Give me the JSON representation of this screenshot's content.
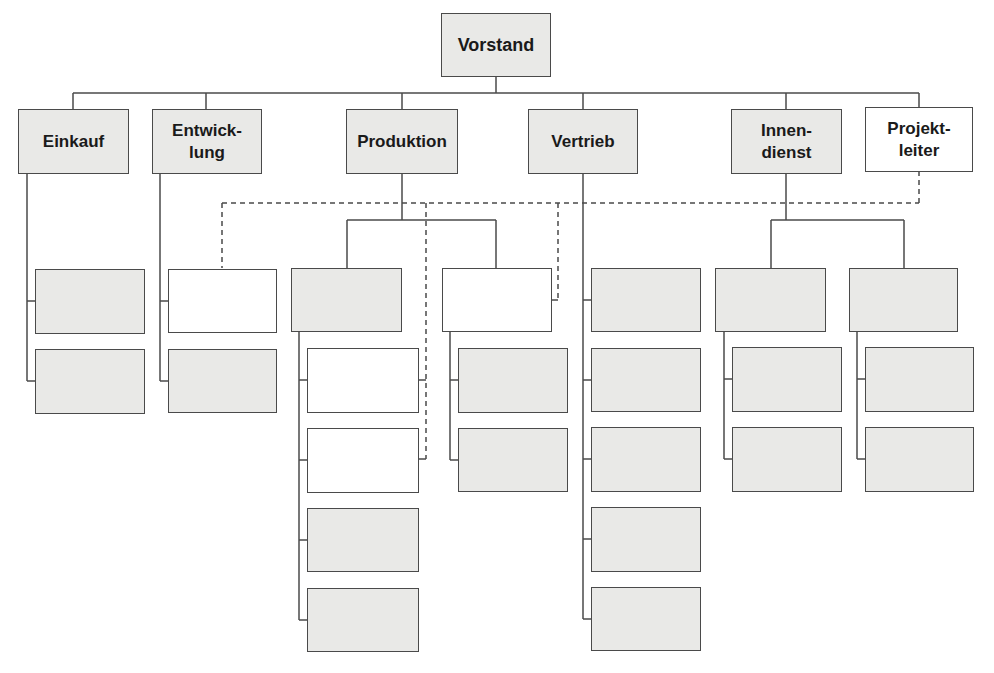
{
  "chart": {
    "root": {
      "label": "Vorstand",
      "fill": "gray"
    },
    "departments": [
      {
        "id": "einkauf",
        "label": "Einkauf",
        "fill": "gray"
      },
      {
        "id": "entwicklung",
        "label": "Entwick-\nlung",
        "fill": "gray"
      },
      {
        "id": "produktion",
        "label": "Produktion",
        "fill": "gray"
      },
      {
        "id": "vertrieb",
        "label": "Vertrieb",
        "fill": "gray"
      },
      {
        "id": "innendienst",
        "label": "Innen-\ndienst",
        "fill": "gray"
      },
      {
        "id": "projektleiter",
        "label": "Projekt-\nleiter",
        "fill": "white"
      }
    ],
    "colors": {
      "box_fill_gray": "#e9e9e7",
      "box_fill_white": "#ffffff",
      "line": "#4a4a4a"
    },
    "legend_note": "Solid lines: line hierarchy; dashed lines: project responsibility from Projektleiter to white (unlabeled) boxes"
  }
}
